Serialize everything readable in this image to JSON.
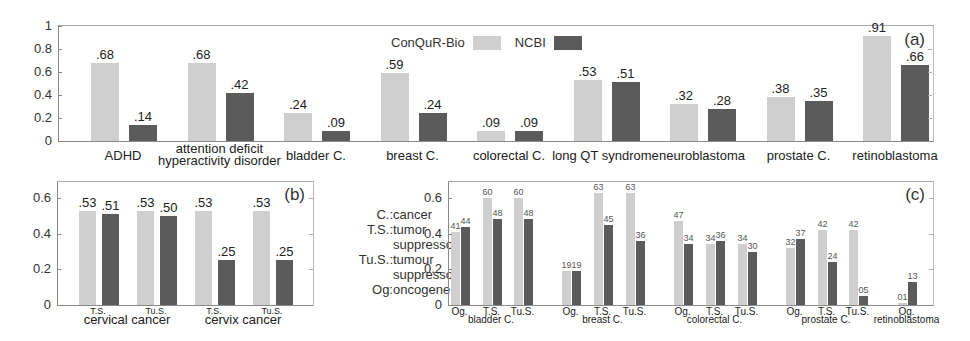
{
  "colors": {
    "conqur_bio": "#cfcfcf",
    "ncbi": "#5b5b5b"
  },
  "legend": {
    "series_1": "ConQuR-Bio",
    "series_2": "NCBI"
  },
  "abbreviations": [
    {
      "key": "C.:",
      "value": "cancer"
    },
    {
      "key": "T.S.:",
      "value": "tumor"
    },
    {
      "key": "",
      "value": "suppressor"
    },
    {
      "key": "Tu.S.:",
      "value": "tumour"
    },
    {
      "key": "",
      "value": "suppressor"
    },
    {
      "key": "Og:",
      "value": "oncogene"
    }
  ],
  "chart_data": [
    {
      "panel": "(a)",
      "type": "bar",
      "title": "",
      "xlabel": "",
      "ylabel": "",
      "ylim": [
        0,
        1
      ],
      "yticks": [
        "0",
        "0.2",
        "0.4",
        "0.6",
        "0.8",
        "1"
      ],
      "legend_position": "top-center",
      "categories": [
        "ADHD",
        "attention deficit hyperactivity disorder",
        "bladder C.",
        "breast C.",
        "colorectal C.",
        "long QT syndrome",
        "neuroblastoma",
        "prostate C.",
        "retinoblastoma"
      ],
      "category_display": [
        [
          "ADHD"
        ],
        [
          "attention deficit",
          "hyperactivity disorder"
        ],
        [
          "bladder C."
        ],
        [
          "breast C."
        ],
        [
          "colorectal C."
        ],
        [
          "long QT syndrome"
        ],
        [
          "neuroblastoma"
        ],
        [
          "prostate C."
        ],
        [
          "retinoblastoma"
        ]
      ],
      "series": [
        {
          "name": "ConQuR-Bio",
          "values": [
            0.68,
            0.68,
            0.24,
            0.59,
            0.09,
            0.53,
            0.32,
            0.38,
            0.91
          ],
          "labels": [
            ".68",
            ".68",
            ".24",
            ".59",
            ".09",
            ".53",
            ".32",
            ".38",
            ".91"
          ]
        },
        {
          "name": "NCBI",
          "values": [
            0.14,
            0.42,
            0.09,
            0.24,
            0.09,
            0.51,
            0.28,
            0.35,
            0.66
          ],
          "labels": [
            ".14",
            ".42",
            ".09",
            ".24",
            ".09",
            ".51",
            ".28",
            ".35",
            ".66"
          ]
        }
      ]
    },
    {
      "panel": "(b)",
      "type": "bar",
      "title": "",
      "xlabel": "",
      "ylabel": "",
      "ylim": [
        0,
        0.69
      ],
      "yticks": [
        "0",
        "0.2",
        "0.4",
        "0.6"
      ],
      "groups": [
        {
          "name": "cervical cancer",
          "categories": [
            "T.S.",
            "Tu.S."
          ]
        },
        {
          "name": "cervix cancer",
          "categories": [
            "T.S.",
            "Tu.S."
          ]
        }
      ],
      "categories": [
        "cervical cancer T.S.",
        "cervical cancer Tu.S.",
        "cervix cancer T.S.",
        "cervix cancer Tu.S."
      ],
      "series": [
        {
          "name": "ConQuR-Bio",
          "values": [
            0.53,
            0.53,
            0.53,
            0.53
          ],
          "labels": [
            ".53",
            ".53",
            ".53",
            ".53"
          ]
        },
        {
          "name": "NCBI",
          "values": [
            0.51,
            0.5,
            0.25,
            0.25
          ],
          "labels": [
            ".51",
            ".50",
            ".25",
            ".25"
          ]
        }
      ]
    },
    {
      "panel": "(c)",
      "type": "bar",
      "title": "",
      "xlabel": "",
      "ylabel": "",
      "ylim": [
        0,
        0.69
      ],
      "yticks": [
        "0",
        "0.2",
        "0.4",
        "0.6"
      ],
      "groups": [
        {
          "name": "bladder C.",
          "categories": [
            "Og.",
            "T.S.",
            "Tu.S."
          ]
        },
        {
          "name": "breast C.",
          "categories": [
            "Og.",
            "T.S.",
            "Tu.S."
          ]
        },
        {
          "name": "colorectal C.",
          "categories": [
            "Og.",
            "T.S.",
            "Tu.S."
          ]
        },
        {
          "name": "prostate C.",
          "categories": [
            "Og.",
            "T.S.",
            "Tu.S."
          ]
        },
        {
          "name": "retinoblastoma",
          "categories": [
            "Og."
          ]
        }
      ],
      "categories": [
        "bladder C. Og.",
        "bladder C. T.S.",
        "bladder C. Tu.S.",
        "breast C. Og.",
        "breast C. T.S.",
        "breast C. Tu.S.",
        "colorectal C. Og.",
        "colorectal C. T.S.",
        "colorectal C. Tu.S.",
        "prostate C. Og.",
        "prostate C. T.S.",
        "prostate C. Tu.S.",
        "retinoblastoma Og."
      ],
      "series": [
        {
          "name": "ConQuR-Bio",
          "values": [
            0.41,
            0.6,
            0.6,
            0.19,
            0.63,
            0.63,
            0.47,
            0.34,
            0.34,
            0.32,
            0.42,
            0.42,
            0.01
          ],
          "labels": [
            "41",
            "60",
            "60",
            "19",
            "63",
            "63",
            "47",
            "34",
            "34",
            "32",
            "42",
            "42",
            "01"
          ]
        },
        {
          "name": "NCBI",
          "values": [
            0.44,
            0.48,
            0.48,
            0.19,
            0.45,
            0.36,
            0.34,
            0.36,
            0.3,
            0.37,
            0.24,
            0.05,
            0.13
          ],
          "labels": [
            "44",
            "48",
            "48",
            "19",
            "45",
            "36",
            "34",
            "36",
            "30",
            "37",
            "24",
            "05",
            "13"
          ]
        }
      ]
    }
  ]
}
